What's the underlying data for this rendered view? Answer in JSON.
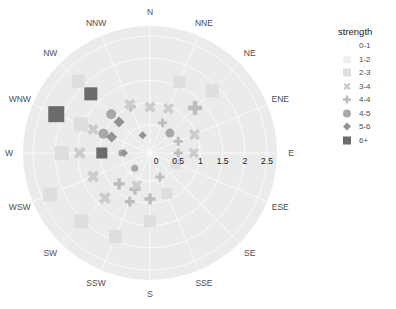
{
  "chart_data": {
    "type": "scatter",
    "subtype": "polar-wind-rose",
    "title": "",
    "radial_axis": {
      "ticks": [
        0,
        0.5,
        1,
        1.5,
        2,
        2.5
      ],
      "tick_labels": [
        "0",
        "0.5",
        "1",
        "1.5",
        "2",
        "2.5"
      ],
      "range": [
        0,
        2.75
      ]
    },
    "angular_axis": {
      "directions": [
        "N",
        "NNE",
        "NE",
        "ENE",
        "E",
        "ESE",
        "SE",
        "SSE",
        "S",
        "SSW",
        "SW",
        "WSW",
        "W",
        "WNW",
        "NW",
        "NNW"
      ]
    },
    "legend": {
      "title": "strength",
      "position": "right",
      "entries": [
        {
          "label": "0-1",
          "shape": "dot",
          "color": "#f7f7f7"
        },
        {
          "label": "1-2",
          "shape": "circle",
          "color": "#efefef"
        },
        {
          "label": "2-3",
          "shape": "square",
          "color": "#dedede"
        },
        {
          "label": "3-4",
          "shape": "cross",
          "color": "#cccccc"
        },
        {
          "label": "4-4",
          "shape": "plus",
          "color": "#bdbdbd"
        },
        {
          "label": "4-5",
          "shape": "circle",
          "color": "#a8a8a8"
        },
        {
          "label": "5-6",
          "shape": "diamond",
          "color": "#939393"
        },
        {
          "label": "6+",
          "shape": "square",
          "color": "#6b6b6b"
        }
      ]
    },
    "points": [
      {
        "dir": "WNW",
        "r": 2.15,
        "strength": "6+",
        "size": 16
      },
      {
        "dir": "NW",
        "r": 1.75,
        "strength": "6+",
        "size": 13
      },
      {
        "dir": "W",
        "r": 0.95,
        "strength": "6+",
        "size": 11
      },
      {
        "dir": "NW",
        "r": 2.15,
        "strength": "2-3",
        "size": 13
      },
      {
        "dir": "WNW",
        "r": 1.55,
        "strength": "2-3",
        "size": 14
      },
      {
        "dir": "W",
        "r": 1.85,
        "strength": "2-3",
        "size": 14
      },
      {
        "dir": "WSW",
        "r": 2.3,
        "strength": "2-3",
        "size": 14
      },
      {
        "dir": "SW",
        "r": 2.05,
        "strength": "2-3",
        "size": 14
      },
      {
        "dir": "SSW",
        "r": 1.9,
        "strength": "2-3",
        "size": 13
      },
      {
        "dir": "S",
        "r": 1.4,
        "strength": "2-3",
        "size": 12
      },
      {
        "dir": "SSE",
        "r": 0.85,
        "strength": "2-3",
        "size": 11
      },
      {
        "dir": "NNE",
        "r": 1.6,
        "strength": "2-3",
        "size": 12
      },
      {
        "dir": "NE",
        "r": 1.85,
        "strength": "2-3",
        "size": 13
      },
      {
        "dir": "ESE",
        "r": 0.5,
        "strength": "2-3",
        "size": 10
      },
      {
        "dir": "NE",
        "r": 1.3,
        "strength": "4-4",
        "size": 14
      },
      {
        "dir": "NNW",
        "r": 1.0,
        "strength": "4-4",
        "size": 10
      },
      {
        "dir": "NNE",
        "r": 0.6,
        "strength": "4-4",
        "size": 9
      },
      {
        "dir": "ENE",
        "r": 0.55,
        "strength": "4-4",
        "size": 9
      },
      {
        "dir": "E",
        "r": 0.5,
        "strength": "4-4",
        "size": 9
      },
      {
        "dir": "SSW",
        "r": 0.75,
        "strength": "4-4",
        "size": 11
      },
      {
        "dir": "SW",
        "r": 0.85,
        "strength": "4-4",
        "size": 11
      },
      {
        "dir": "S",
        "r": 0.9,
        "strength": "4-4",
        "size": 11
      },
      {
        "dir": "SSW",
        "r": 1.05,
        "strength": "4-4",
        "size": 10
      },
      {
        "dir": "SSE",
        "r": 0.45,
        "strength": "4-4",
        "size": 9
      },
      {
        "dir": "N",
        "r": 0.9,
        "strength": "3-4",
        "size": 12
      },
      {
        "dir": "NNE",
        "r": 0.95,
        "strength": "3-4",
        "size": 12
      },
      {
        "dir": "ENE",
        "r": 0.95,
        "strength": "3-4",
        "size": 12
      },
      {
        "dir": "E",
        "r": 0.85,
        "strength": "3-4",
        "size": 11
      },
      {
        "dir": "NNW",
        "r": 1.05,
        "strength": "3-4",
        "size": 12
      },
      {
        "dir": "WNW",
        "r": 1.25,
        "strength": "3-4",
        "size": 12
      },
      {
        "dir": "W",
        "r": 1.45,
        "strength": "3-4",
        "size": 13
      },
      {
        "dir": "WSW",
        "r": 1.25,
        "strength": "3-4",
        "size": 13
      },
      {
        "dir": "SW",
        "r": 1.3,
        "strength": "3-4",
        "size": 13
      },
      {
        "dir": "SSW",
        "r": 0.65,
        "strength": "3-4",
        "size": 11
      },
      {
        "dir": "NW",
        "r": 1.1,
        "strength": "4-5",
        "size": 10
      },
      {
        "dir": "WNW",
        "r": 1.0,
        "strength": "4-5",
        "size": 10
      },
      {
        "dir": "W",
        "r": 0.5,
        "strength": "4-5",
        "size": 7
      },
      {
        "dir": "NE",
        "r": 0.5,
        "strength": "4-5",
        "size": 9
      },
      {
        "dir": "SW",
        "r": 0.35,
        "strength": "4-5",
        "size": 7
      },
      {
        "dir": "NW",
        "r": 0.85,
        "strength": "5-6",
        "size": 11
      },
      {
        "dir": "WNW",
        "r": 0.8,
        "strength": "5-6",
        "size": 11
      },
      {
        "dir": "NNW",
        "r": 0.3,
        "strength": "5-6",
        "size": 8
      },
      {
        "dir": "W",
        "r": 0.45,
        "strength": "5-6",
        "size": 8
      }
    ]
  },
  "axis_labels": {
    "directions": [
      "N",
      "NNE",
      "NE",
      "ENE",
      "E",
      "ESE",
      "SE",
      "SSE",
      "S",
      "SSW",
      "SW",
      "WSW",
      "W",
      "WNW",
      "NW",
      "NNW"
    ],
    "ticks": [
      "0",
      "0.5",
      "1",
      "1.5",
      "2",
      "2.5"
    ]
  },
  "legend": {
    "title": "strength",
    "items": [
      {
        "label": "0-1"
      },
      {
        "label": "1-2"
      },
      {
        "label": "2-3"
      },
      {
        "label": "3-4"
      },
      {
        "label": "4-4"
      },
      {
        "label": "4-5"
      },
      {
        "label": "5-6"
      },
      {
        "label": "6+"
      }
    ]
  },
  "colors": {
    "panel": "#ebebeb",
    "grid": "#ffffff",
    "text": "#4d4d4d"
  }
}
